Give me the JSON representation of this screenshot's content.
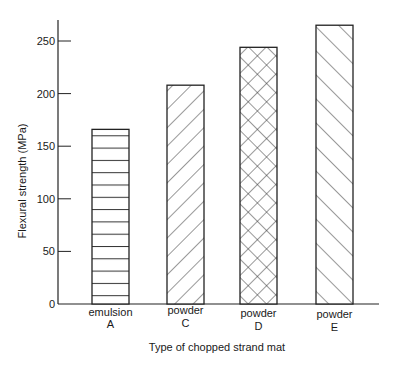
{
  "chart_data": {
    "type": "bar",
    "title": "",
    "xlabel": "Type of chopped strand mat",
    "ylabel": "Flexural strength (MPa)",
    "ylim": [
      0,
      270
    ],
    "yticks": [
      0,
      50,
      100,
      150,
      200,
      250
    ],
    "grid": false,
    "legend": null,
    "categories": [
      {
        "line1": "emulsion",
        "line2": "A"
      },
      {
        "line1": "powder",
        "line2": "C"
      },
      {
        "line1": "powder",
        "line2": "D"
      },
      {
        "line1": "powder",
        "line2": "E"
      }
    ],
    "values": [
      166,
      208,
      244,
      265
    ],
    "patterns": [
      "horizontal-lines",
      "forward-diagonal",
      "crosshatch",
      "backward-diagonal"
    ],
    "bar_fill": "#ffffff",
    "bar_stroke": "#222222"
  }
}
